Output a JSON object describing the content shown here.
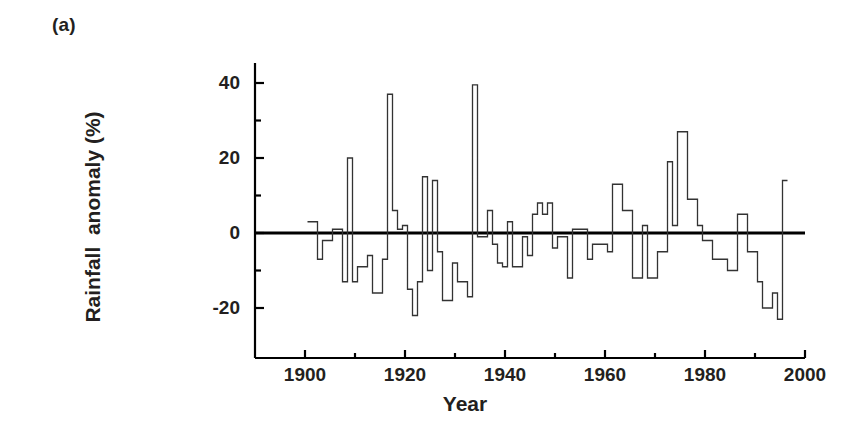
{
  "panel": {
    "label": "(a)"
  },
  "axes": {
    "ylabel": "Rainfall  anomaly (%)",
    "xlabel": "Year"
  },
  "chart_data": {
    "type": "line",
    "subtype": "step",
    "title": "",
    "xlabel": "Year",
    "ylabel": "Rainfall  anomaly (%)",
    "xlim": [
      1890,
      2000
    ],
    "ylim": [
      -28,
      45
    ],
    "xticks": [
      1900,
      1920,
      1940,
      1960,
      1980,
      2000
    ],
    "xticklabels": [
      "1900",
      "1920",
      "1940",
      "1960",
      "1980",
      "2000"
    ],
    "xminorticks": [
      1910,
      1930,
      1950,
      1970,
      1990
    ],
    "yticks": [
      -20,
      0,
      20,
      40
    ],
    "yticklabels": [
      "-20",
      "0",
      "20",
      "40"
    ],
    "yminorticks": [
      -10,
      10,
      30
    ],
    "grid": false,
    "legend": null,
    "zero_line": 0,
    "line_color": "#333333",
    "zero_line_color": "#000000",
    "x": [
      1901,
      1902,
      1903,
      1904,
      1905,
      1906,
      1907,
      1908,
      1909,
      1910,
      1911,
      1912,
      1913,
      1914,
      1915,
      1916,
      1917,
      1918,
      1919,
      1920,
      1921,
      1922,
      1923,
      1924,
      1925,
      1926,
      1927,
      1928,
      1929,
      1930,
      1931,
      1932,
      1933,
      1934,
      1935,
      1936,
      1937,
      1938,
      1939,
      1940,
      1941,
      1942,
      1943,
      1944,
      1945,
      1946,
      1947,
      1948,
      1949,
      1950,
      1951,
      1952,
      1953,
      1954,
      1955,
      1956,
      1957,
      1958,
      1959,
      1960,
      1961,
      1962,
      1963,
      1964,
      1965,
      1966,
      1967,
      1968,
      1969,
      1970,
      1971,
      1972,
      1973,
      1974,
      1975,
      1976,
      1977,
      1978,
      1979,
      1980,
      1981,
      1982,
      1983,
      1984,
      1985,
      1986,
      1987,
      1988,
      1989,
      1990,
      1991,
      1992,
      1993,
      1994,
      1995,
      1996
    ],
    "values": [
      3,
      3,
      -7,
      -2,
      -2,
      1,
      1,
      -13,
      20,
      -13,
      -9,
      -9,
      -6,
      -16,
      -16,
      -7,
      37,
      6,
      1,
      2,
      -15,
      -22,
      -13,
      15,
      -10,
      14,
      -5,
      -18,
      -18,
      -8,
      -13,
      -13,
      -17,
      39.5,
      -1,
      -1,
      6,
      -3,
      -8,
      -9,
      3,
      -9,
      -9,
      -1,
      -6,
      5,
      8,
      5,
      8,
      -4,
      -1,
      -1,
      -12,
      1,
      1,
      1,
      -7,
      -3,
      -3,
      -3,
      -5,
      13,
      13,
      6,
      6,
      -12,
      -12,
      2,
      -12,
      -12,
      -5,
      -5,
      19,
      2,
      27,
      27,
      9,
      9,
      2,
      -2,
      -2,
      -7,
      -7,
      -7,
      -10,
      -10,
      5,
      5,
      -5,
      -5,
      -13,
      -20,
      -20,
      -16,
      -23,
      14
    ]
  }
}
